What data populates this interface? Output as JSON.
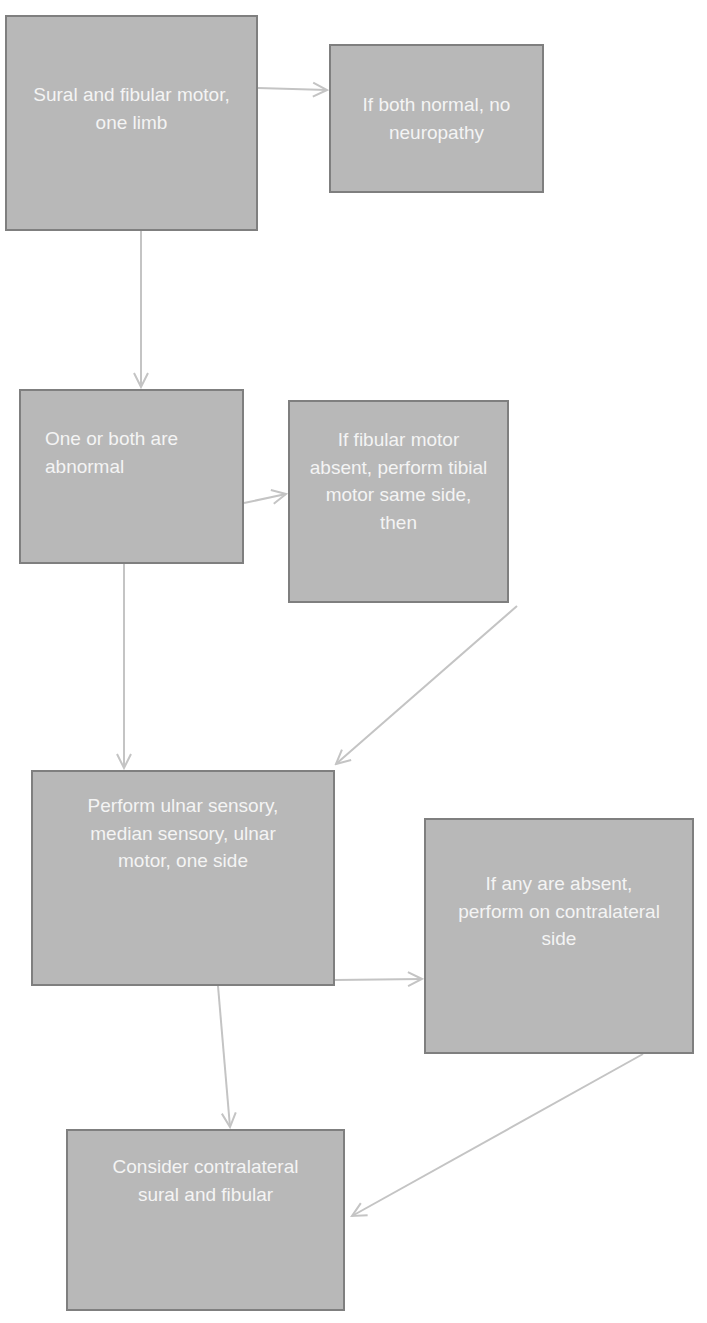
{
  "diagram": {
    "type": "flowchart",
    "colors": {
      "node_fill": "#b8b8b8",
      "node_border": "#7f7f7f",
      "node_text": "#f4f4f4",
      "edge": "#c4c4c4",
      "background": "#ffffff"
    },
    "nodes": [
      {
        "id": "n1",
        "label": "Sural and fibular motor, one limb"
      },
      {
        "id": "n2",
        "label": "If both normal, no neuropathy"
      },
      {
        "id": "n3",
        "label": "One or both are abnormal"
      },
      {
        "id": "n4",
        "label": "If fibular motor absent, perform tibial motor same side, then"
      },
      {
        "id": "n5",
        "label": "Perform ulnar sensory, median sensory, ulnar motor, one side"
      },
      {
        "id": "n6",
        "label": "If any are absent, perform on contralateral side"
      },
      {
        "id": "n7",
        "label": "Consider contralateral sural and fibular"
      }
    ],
    "edges": [
      {
        "from": "n1",
        "to": "n2"
      },
      {
        "from": "n1",
        "to": "n3"
      },
      {
        "from": "n3",
        "to": "n4"
      },
      {
        "from": "n3",
        "to": "n5"
      },
      {
        "from": "n4",
        "to": "n5"
      },
      {
        "from": "n5",
        "to": "n6"
      },
      {
        "from": "n5",
        "to": "n7"
      },
      {
        "from": "n6",
        "to": "n7"
      }
    ]
  }
}
